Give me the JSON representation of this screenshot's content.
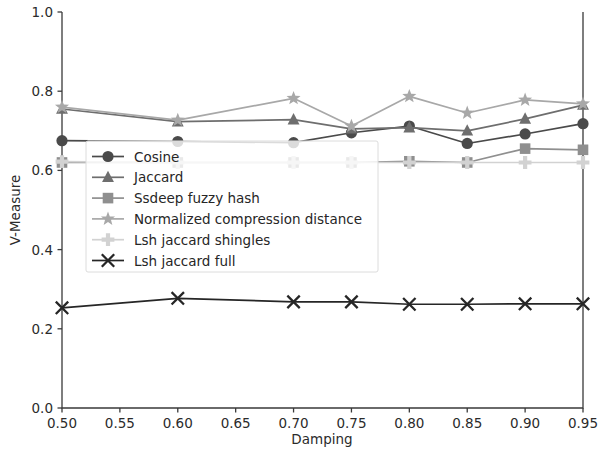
{
  "chart_data": {
    "type": "line",
    "title": "",
    "xlabel": "Damping",
    "ylabel": "V-Measure",
    "xlim": [
      0.5,
      0.95
    ],
    "ylim": [
      0.0,
      1.0
    ],
    "x": [
      0.5,
      0.6,
      0.7,
      0.75,
      0.8,
      0.85,
      0.9,
      0.95
    ],
    "xticks": [
      "0.50",
      "0.55",
      "0.60",
      "0.65",
      "0.70",
      "0.75",
      "0.80",
      "0.85",
      "0.90",
      "0.95"
    ],
    "xtick_values": [
      0.5,
      0.55,
      0.6,
      0.65,
      0.7,
      0.75,
      0.8,
      0.85,
      0.9,
      0.95
    ],
    "yticks": [
      "0.0",
      "0.2",
      "0.4",
      "0.6",
      "0.8",
      "1.0"
    ],
    "ytick_values": [
      0.0,
      0.2,
      0.4,
      0.6,
      0.8,
      1.0
    ],
    "grid": false,
    "legend_position": "center-left",
    "series": [
      {
        "name": "Cosine",
        "marker": "circle",
        "color": "#4a4a4a",
        "values": [
          0.675,
          0.673,
          0.67,
          0.695,
          0.712,
          0.668,
          0.692,
          0.718
        ]
      },
      {
        "name": "Jaccard",
        "marker": "triangle",
        "color": "#6e6e6e",
        "values": [
          0.755,
          0.723,
          0.728,
          0.705,
          0.708,
          0.7,
          0.73,
          0.765
        ]
      },
      {
        "name": "Ssdeep fuzzy hash",
        "marker": "square",
        "color": "#8f8f8f",
        "values": [
          0.62,
          0.62,
          0.62,
          0.62,
          0.623,
          0.62,
          0.655,
          0.652
        ]
      },
      {
        "name": "Normalized compression distance",
        "marker": "star",
        "color": "#a8a8a8",
        "values": [
          0.76,
          0.727,
          0.782,
          0.712,
          0.787,
          0.745,
          0.778,
          0.768
        ]
      },
      {
        "name": "Lsh jaccard shingles",
        "marker": "plus",
        "color": "#d2d2d2",
        "values": [
          0.622,
          0.62,
          0.62,
          0.62,
          0.62,
          0.62,
          0.62,
          0.62
        ]
      },
      {
        "name": "Lsh jaccard full",
        "marker": "x",
        "color": "#262626",
        "values": [
          0.253,
          0.277,
          0.268,
          0.268,
          0.262,
          0.262,
          0.263,
          0.263
        ]
      }
    ]
  },
  "legend": {
    "items": [
      {
        "label": "Cosine"
      },
      {
        "label": "Jaccard"
      },
      {
        "label": "Ssdeep fuzzy hash"
      },
      {
        "label": "Normalized compression distance"
      },
      {
        "label": "Lsh jaccard shingles"
      },
      {
        "label": "Lsh jaccard full"
      }
    ]
  },
  "axes": {
    "x_title": "Damping",
    "y_title": "V-Measure"
  }
}
